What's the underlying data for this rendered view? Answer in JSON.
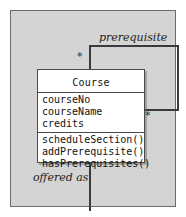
{
  "diagram": {
    "type": "uml-class-diagram",
    "background_color": "#d4d4d4",
    "frame_border_color": "#6b6b6b"
  },
  "class_box": {
    "name": "Course",
    "attributes": [
      "courseNo",
      "courseName",
      "credits"
    ],
    "operations": [
      "scheduleSection()",
      "addPrerequisite()",
      "hasPrerequisites()"
    ],
    "fill_color": "#ffffff",
    "border_color": "#4a4a4a"
  },
  "associations": [
    {
      "name": "prerequisite",
      "kind": "self-association",
      "source_multiplicity": "*",
      "target_multiplicity": "*"
    },
    {
      "name": "offered as",
      "kind": "association",
      "source_multiplicity": "",
      "target_multiplicity": ""
    }
  ],
  "labels": {
    "prerequisite": "prerequisite",
    "offered_as": "offered as"
  },
  "multiplicities": {
    "left": "*",
    "right": "*"
  }
}
